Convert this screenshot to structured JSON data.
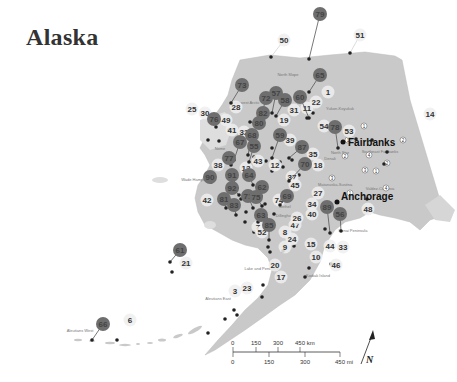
{
  "title": "Alaska",
  "colors": {
    "land": "#c9c9c9",
    "land_light": "#dedede",
    "dark_marker": "#6e6e6e",
    "light_marker": "#eeeeee",
    "point": "#222222"
  },
  "cities": [
    {
      "name": "Fairbanks"
    },
    {
      "name": "Anchorage"
    }
  ],
  "regions": [
    "North Slope",
    "Northwest Arctic",
    "Yukon-Koyukuk",
    "Nome",
    "Wade Hampton",
    "Bethel",
    "Dillingham",
    "Lake and Peninsula",
    "Aleutians East",
    "Aleutians West",
    "Kodiak Island",
    "Kenai Peninsula",
    "Matanuska-Susitna",
    "Denali",
    "Southeast Fairbanks",
    "Valdez-Cordova",
    "North Star"
  ],
  "dark_markers": [
    "79",
    "65",
    "73",
    "57",
    "72",
    "58",
    "82",
    "60",
    "76",
    "78",
    "67",
    "68",
    "59",
    "55",
    "87",
    "77",
    "70",
    "90",
    "91",
    "64",
    "92",
    "81",
    "62",
    "83",
    "71",
    "75",
    "63",
    "69",
    "85",
    "89",
    "56",
    "61",
    "80",
    "66"
  ],
  "light_markers": [
    "50",
    "51",
    "1",
    "22",
    "31",
    "11",
    "28",
    "25",
    "30",
    "49",
    "41",
    "32",
    "19",
    "54",
    "53",
    "14",
    "39",
    "35",
    "18",
    "38",
    "13",
    "43",
    "12",
    "37",
    "42",
    "45",
    "27",
    "34",
    "7",
    "47",
    "40",
    "26",
    "52",
    "8",
    "24",
    "9",
    "15",
    "48",
    "44",
    "33",
    "10",
    "46",
    "20",
    "17",
    "3",
    "23",
    "21",
    "6",
    "74"
  ],
  "small_circled_numbers": [
    "1",
    "2",
    "2",
    "4",
    "3",
    "1",
    "3",
    "4",
    "1",
    "2",
    "1"
  ],
  "scale_bar": {
    "km_labels": [
      "0",
      "150",
      "300",
      "450 km"
    ],
    "mi_labels": [
      "0",
      "150",
      "300",
      "450 mi"
    ]
  },
  "north_arrow": {
    "label": "N"
  }
}
